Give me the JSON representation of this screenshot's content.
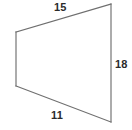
{
  "figure": {
    "kind": "quadrilateral",
    "background_color": "#ffffff",
    "stroke_color": "#6f6f6f",
    "label_color": "#2b2b2b",
    "vertices": [
      {
        "name": "top-left",
        "x": 16,
        "y": 32
      },
      {
        "name": "top-right",
        "x": 111,
        "y": 4
      },
      {
        "name": "bottom-right",
        "x": 111,
        "y": 122
      },
      {
        "name": "bottom-left",
        "x": 16,
        "y": 86
      }
    ],
    "sides": [
      {
        "name": "top-side",
        "label": "15",
        "labeled": true,
        "from": "top-left",
        "to": "top-right"
      },
      {
        "name": "right-side",
        "label": "18",
        "labeled": true,
        "from": "top-right",
        "to": "bottom-right"
      },
      {
        "name": "bottom-side",
        "label": "11",
        "labeled": true,
        "from": "bottom-right",
        "to": "bottom-left"
      },
      {
        "name": "left-side",
        "label": "",
        "labeled": false,
        "from": "bottom-left",
        "to": "top-left"
      }
    ],
    "labels": {
      "top": "15",
      "right": "18",
      "bottom": "11"
    }
  }
}
